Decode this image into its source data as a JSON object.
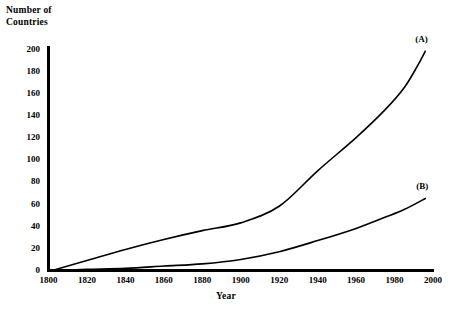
{
  "chart_data": {
    "type": "line",
    "title": "",
    "xlabel": "Year",
    "ylabel": "Number of\nCountries",
    "ylabel_line1": "Number of",
    "ylabel_line2": "Countries",
    "xlim": [
      1800,
      2000
    ],
    "ylim": [
      0,
      200
    ],
    "grid": false,
    "legend_position": "inline-end-of-curve",
    "xticks": [
      1800,
      1820,
      1840,
      1860,
      1880,
      1900,
      1920,
      1940,
      1960,
      1980,
      2000
    ],
    "yticks": [
      0,
      20,
      40,
      60,
      80,
      100,
      120,
      140,
      160,
      180,
      200
    ],
    "series": [
      {
        "name": "(A)",
        "label": "(A)",
        "color": "#000000",
        "x": [
          1802,
          1820,
          1840,
          1860,
          1880,
          1900,
          1920,
          1940,
          1960,
          1975,
          1985,
          1992,
          1996
        ],
        "values": [
          0,
          9,
          19,
          28,
          36,
          43,
          58,
          90,
          120,
          145,
          165,
          185,
          198
        ]
      },
      {
        "name": "(B)",
        "label": "(B)",
        "color": "#000000",
        "x": [
          1805,
          1820,
          1840,
          1860,
          1880,
          1900,
          1920,
          1940,
          1960,
          1975,
          1985,
          1996
        ],
        "values": [
          0,
          1,
          2,
          4,
          6,
          10,
          17,
          27,
          38,
          48,
          55,
          65
        ]
      }
    ]
  },
  "colors": {
    "axis": "#000000",
    "curve": "#000000",
    "background": "#ffffff"
  }
}
